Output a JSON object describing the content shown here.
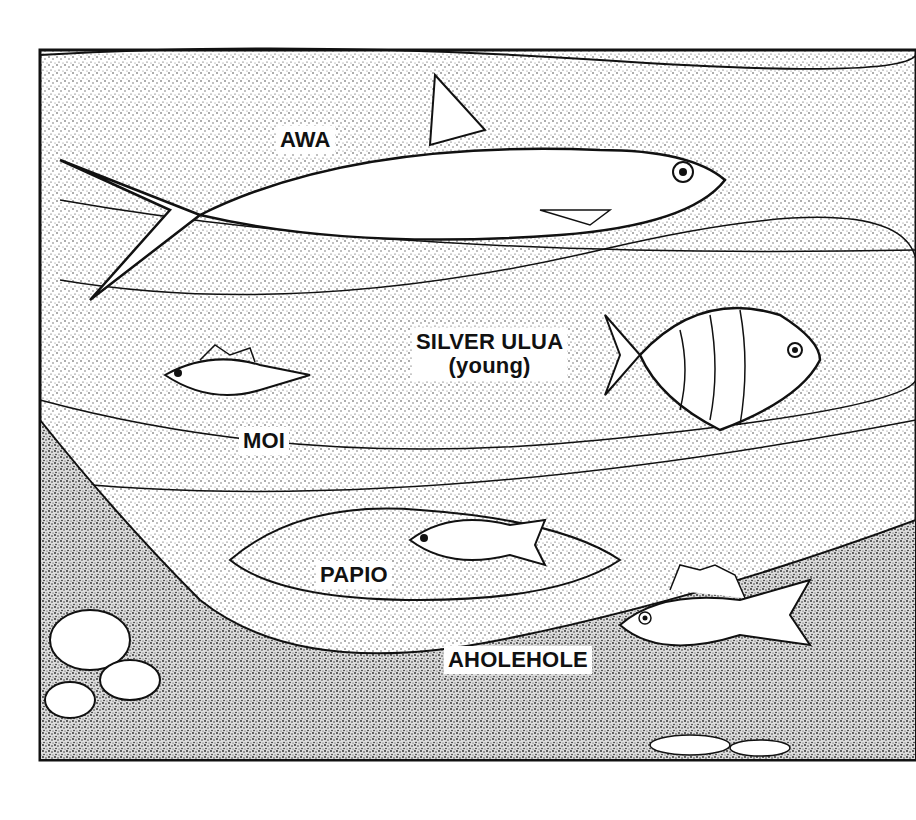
{
  "illustration": {
    "subject": "Hawaiian reef and shore fish illustration",
    "colors": {
      "ink": "#111111",
      "paper": "#ffffff",
      "stipple": "#9a9a9a"
    }
  },
  "labels": {
    "awa": "AWA",
    "silver_ulua_line1": "SILVER ULUA",
    "silver_ulua_line2": "(young)",
    "moi": "MOI",
    "papio": "PAPIO",
    "aholehole": "AHOLEHOLE"
  }
}
